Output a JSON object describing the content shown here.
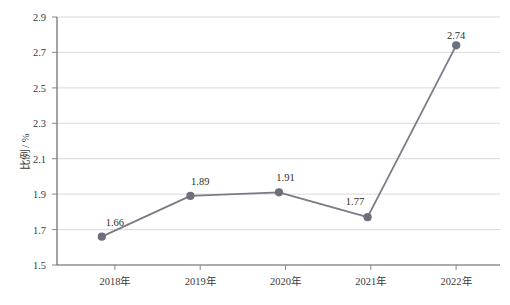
{
  "chart_data": {
    "type": "line",
    "title": "",
    "xlabel": "",
    "ylabel": "比例 / %",
    "categories": [
      "2018年",
      "2019年",
      "2020年",
      "2021年",
      "2022年"
    ],
    "values": [
      1.66,
      1.89,
      1.91,
      1.77,
      2.74
    ],
    "point_labels": [
      "1.66",
      "1.89",
      "1.91",
      "1.77",
      "2.74"
    ],
    "series": [
      {
        "name": "比例",
        "values": [
          1.66,
          1.89,
          1.91,
          1.77,
          2.74
        ]
      }
    ],
    "ylim": [
      1.5,
      2.9
    ],
    "ytick_step": 0.2,
    "ytick_labels": [
      "1.5",
      "1.7",
      "1.9",
      "2.1",
      "2.3",
      "2.5",
      "2.7",
      "2.9"
    ],
    "ytick_values": [
      1.5,
      1.7,
      1.9,
      2.1,
      2.3,
      2.5,
      2.7,
      2.9
    ],
    "grid": "horizontal",
    "legend": "none",
    "marker": "circle",
    "colors": {
      "line": "#7b7a88",
      "marker": "#6f6e7c",
      "gridline": "#d9d9d9",
      "axis": "#595959",
      "background": "#ffffff",
      "text": "#333333"
    }
  }
}
